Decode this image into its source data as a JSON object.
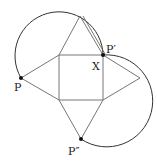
{
  "diagram": {
    "title": "",
    "colors": {
      "stroke": "#555555",
      "arc": "#333333",
      "point": "#111111",
      "background": "#ffffff"
    },
    "square": {
      "corners": [
        [
          59,
          55
        ],
        [
          103,
          55
        ],
        [
          103,
          100
        ],
        [
          59,
          100
        ]
      ]
    },
    "triangles": [
      {
        "name": "top",
        "points": [
          [
            59,
            55
          ],
          [
            80,
            16
          ],
          [
            103,
            55
          ]
        ]
      },
      {
        "name": "left",
        "points": [
          [
            59,
            55
          ],
          [
            21,
            78
          ],
          [
            59,
            100
          ]
        ]
      },
      {
        "name": "right",
        "points": [
          [
            103,
            55
          ],
          [
            140,
            78
          ],
          [
            103,
            100
          ]
        ]
      },
      {
        "name": "bottom",
        "points": [
          [
            59,
            100
          ],
          [
            81,
            139
          ],
          [
            103,
            100
          ]
        ]
      }
    ],
    "extra_segment": {
      "from": [
        80,
        16
      ],
      "to": [
        103,
        55
      ]
    },
    "points": [
      {
        "id": "P",
        "x": 21,
        "y": 78,
        "label": "P"
      },
      {
        "id": "P_prime",
        "x": 103,
        "y": 55,
        "label": "P′"
      },
      {
        "id": "P_double_prime",
        "x": 81,
        "y": 139,
        "label": "P″"
      }
    ],
    "labels": {
      "P": "P",
      "P_prime": "P′",
      "P_double_prime": "P″",
      "X": "X"
    }
  }
}
